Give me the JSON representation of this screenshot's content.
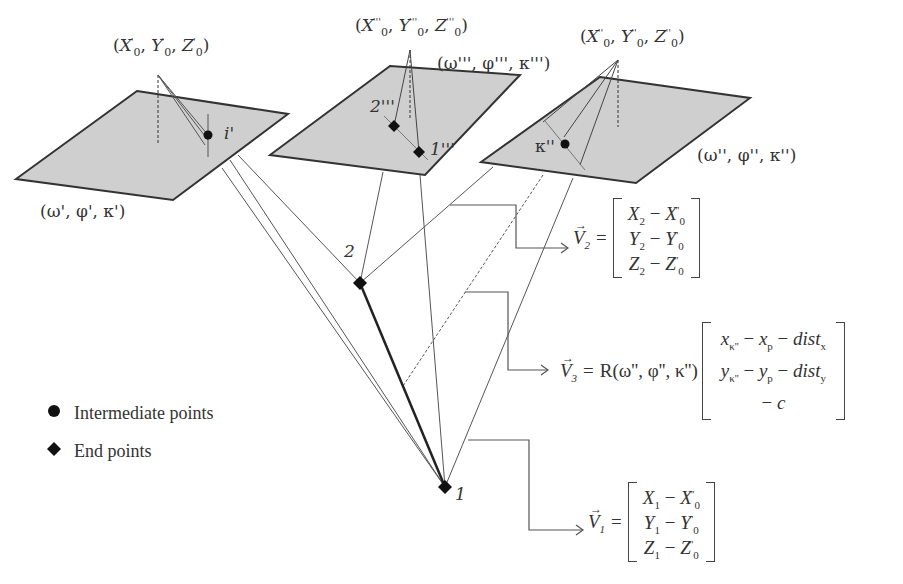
{
  "diagram": {
    "type": "photogrammetry multi-image intersection",
    "planes": [
      {
        "id": "left",
        "fill": "#cfcfcf",
        "orientation_label": "(ω', φ', κ')",
        "projection_center_label": {
          "X": "X",
          "Y": "Y",
          "Z": "Z",
          "sub": "0",
          "prime": "'"
        },
        "image_point_label": "i'"
      },
      {
        "id": "middle",
        "fill": "#cfcfcf",
        "orientation_label": "(ω''', φ''', κ''')",
        "projection_center_label": {
          "X": "X",
          "Y": "Y",
          "Z": "Z",
          "sub": "0",
          "prime": "'''"
        },
        "image_point_labels": [
          "2'''",
          "1'''"
        ]
      },
      {
        "id": "right",
        "fill": "#cfcfcf",
        "orientation_label": "(ω'', φ'', κ'')",
        "projection_center_label": {
          "X": "X",
          "Y": "Y",
          "Z": "Z",
          "sub": "0",
          "prime": "''"
        },
        "image_point_label": "κ''"
      }
    ],
    "object_points": [
      {
        "id": "2",
        "label": "2",
        "type": "end"
      },
      {
        "id": "1",
        "label": "1",
        "type": "end"
      }
    ],
    "equations": {
      "v2": {
        "name": "V",
        "sub": "2",
        "rows": [
          {
            "a": "X",
            "asub": "2",
            "b": "X",
            "bsub": "0",
            "bsup": "''"
          },
          {
            "a": "Y",
            "asub": "2",
            "b": "Y",
            "bsub": "0",
            "bsup": "''"
          },
          {
            "a": "Z",
            "asub": "2",
            "b": "Z",
            "bsub": "0",
            "bsup": "''"
          }
        ]
      },
      "v3": {
        "name": "V",
        "sub": "3",
        "rotation": "R(ω'', φ'', κ'')",
        "rows": [
          "x_κ'' − x_p − dist_x",
          "y_κ'' − y_p − dist_y",
          "− c"
        ]
      },
      "v1": {
        "name": "V",
        "sub": "1",
        "rows": [
          {
            "a": "X",
            "asub": "1",
            "b": "X",
            "bsub": "0",
            "bsup": "''"
          },
          {
            "a": "Y",
            "asub": "1",
            "b": "Y",
            "bsub": "0",
            "bsup": "''"
          },
          {
            "a": "Z",
            "asub": "1",
            "b": "Z",
            "bsub": "0",
            "bsup": "''"
          }
        ]
      }
    },
    "legend": [
      {
        "symbol": "circle",
        "label": "Intermediate points"
      },
      {
        "symbol": "diamond",
        "label": "End points"
      }
    ],
    "text": {
      "eq": "=",
      "minus": "−",
      "vec_arrow": "→",
      "open": "(",
      "close": ")",
      "comma": ", ",
      "x": "x",
      "y": "y",
      "kpp": "κ''",
      "p": "p",
      "dist": "dist",
      "sx": "x",
      "sy": "y",
      "c": "c"
    },
    "colors": {
      "plane_fill": "#cfcfcf",
      "stroke": "#333333",
      "text": "#333333"
    }
  }
}
